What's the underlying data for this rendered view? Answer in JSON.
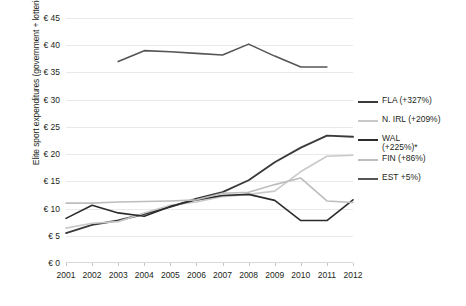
{
  "chart_data": {
    "type": "line",
    "title": "",
    "xlabel": "",
    "ylabel": "Elite sport expenditures (government + lotteries)",
    "categories": [
      "2001",
      "2002",
      "2003",
      "2004",
      "2005",
      "2006",
      "2007",
      "2008",
      "2009",
      "2010",
      "2011",
      "2012"
    ],
    "x": [
      2001,
      2002,
      2003,
      2004,
      2005,
      2006,
      2007,
      2008,
      2009,
      2010,
      2011,
      2012
    ],
    "ylim": [
      0,
      45
    ],
    "yticks": [
      "€ 0",
      "€ 5",
      "€ 10",
      "€ 15",
      "€ 20",
      "€ 25",
      "€ 30",
      "€ 35",
      "€ 40",
      "€ 45"
    ],
    "ytick_values": [
      0,
      5,
      10,
      15,
      20,
      25,
      30,
      35,
      40,
      45
    ],
    "grid": true,
    "legend_position": "right",
    "series": [
      {
        "name": "FLA (+327%)",
        "color": "#3a3a3a",
        "width": 1.9,
        "values": [
          5.5,
          7.0,
          7.8,
          9.0,
          10.3,
          11.8,
          13.0,
          15.2,
          18.5,
          21.2,
          23.4,
          23.2
        ]
      },
      {
        "name": "N. IRL (+209%)",
        "color": "#c9c9c9",
        "width": 1.6,
        "values": [
          6.4,
          7.3,
          7.6,
          9.2,
          10.6,
          11.2,
          12.2,
          12.6,
          13.2,
          16.8,
          19.6,
          19.8
        ]
      },
      {
        "name": "WAL\n(+225%)*",
        "color": "#2b2b2b",
        "width": 1.6,
        "values": [
          8.2,
          10.6,
          9.2,
          8.6,
          10.4,
          11.6,
          12.4,
          12.6,
          11.5,
          7.8,
          7.8,
          11.6
        ]
      },
      {
        "name": "FIN (+86%)",
        "color": "#bdbdbd",
        "width": 1.6,
        "values": [
          11.0,
          11.0,
          11.2,
          11.3,
          11.4,
          11.6,
          12.8,
          13.0,
          14.4,
          15.6,
          11.4,
          11.1
        ]
      },
      {
        "name": "EST +5%)",
        "color": "#555555",
        "width": 1.6,
        "values": [
          null,
          null,
          37.0,
          39.0,
          38.8,
          38.5,
          38.2,
          40.2,
          38.0,
          36.0,
          36.0,
          null
        ]
      }
    ]
  },
  "legend": {
    "items": [
      {
        "label": "FLA (+327%)"
      },
      {
        "label": "N. IRL (+209%)"
      },
      {
        "label": "WAL\n(+225%)*"
      },
      {
        "label": "FIN (+86%)"
      },
      {
        "label": "EST +5%)"
      }
    ]
  }
}
